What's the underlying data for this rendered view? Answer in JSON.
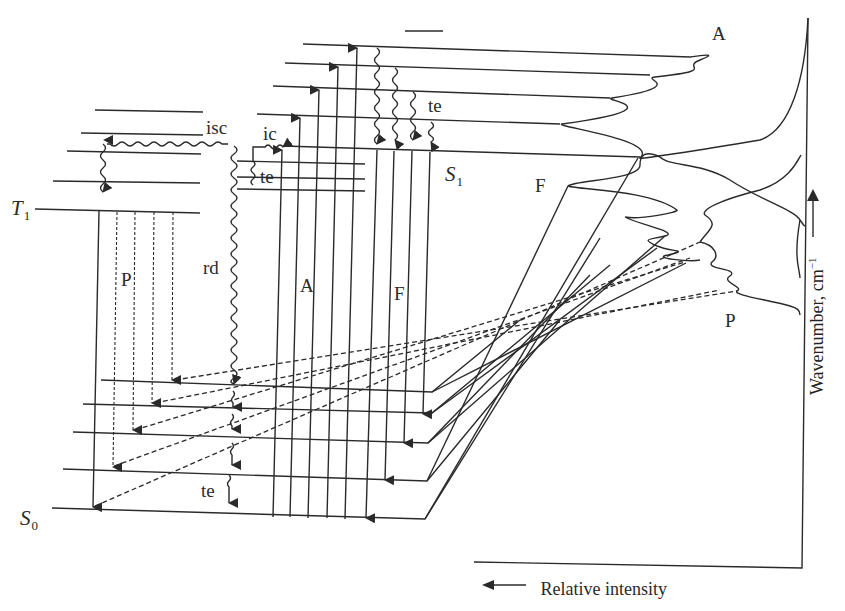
{
  "diagram": {
    "labels": {
      "absorption_spectrum": "A",
      "fluorescence_spectrum": "F",
      "phosphorescence_spectrum": "P",
      "absorption_arrows": "A",
      "fluorescence_arrows": "F",
      "phosphorescence_arrows": "P",
      "intersystem_crossing": "isc",
      "internal_conversion": "ic",
      "thermal_equilibration_top": "te",
      "thermal_equilibration_mid": "te",
      "thermal_equilibration_bottom": "te",
      "radiationless_deactivation": "rd",
      "singlet_excited": "S",
      "singlet_excited_sub": "1",
      "triplet": "T",
      "triplet_sub": "1",
      "ground_state": "S",
      "ground_state_sub": "0"
    },
    "axes": {
      "x_label": "Relative intensity",
      "y_label": "Wavenumber, cm",
      "y_label_exp": "−1"
    },
    "levels": {
      "S0": 5,
      "S1": 5,
      "T1": 5,
      "S_upper_ic": 4
    },
    "processes": [
      "A (absorption)",
      "F (fluorescence)",
      "P (phosphorescence)",
      "isc",
      "ic",
      "te",
      "rd"
    ]
  }
}
